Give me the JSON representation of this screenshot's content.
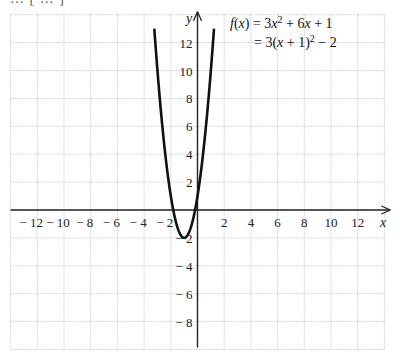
{
  "chart_data": {
    "type": "line",
    "title": "",
    "xlabel": "x",
    "ylabel": "y",
    "xlim": [
      -14,
      14
    ],
    "ylim": [
      -10,
      14
    ],
    "grid": true,
    "x_ticks": [
      -12,
      -10,
      -8,
      -6,
      -4,
      -2,
      2,
      4,
      6,
      8,
      10,
      12
    ],
    "x_tick_labels": [
      "− 12",
      "− 10",
      "− 8",
      "− 6",
      "− 4",
      "− 2",
      "2",
      "4",
      "6",
      "8",
      "10",
      "12"
    ],
    "y_ticks": [
      12,
      10,
      8,
      6,
      4,
      2,
      -2,
      -4,
      -6,
      -8
    ],
    "y_tick_labels": [
      "12",
      "10",
      "8",
      "6",
      "4",
      "2",
      "− 2",
      "− 4",
      "− 6",
      "− 8"
    ],
    "annotations": {
      "line1": "f(x) = 3x² + 6x + 1",
      "line2": "= 3(x + 1)² − 2"
    },
    "series": [
      {
        "name": "f(x) = 3x^2 + 6x + 1",
        "function": "3x^2 + 6x + 1",
        "domain": [
          -3.236,
          1.236
        ],
        "vertex": [
          -1,
          -2
        ],
        "y_intercept": 1,
        "x": [
          -3.236,
          -3,
          -2.5,
          -2,
          -1.5,
          -1,
          -0.5,
          0,
          0.5,
          1,
          1.236
        ],
        "values": [
          13,
          10,
          4.75,
          1,
          -1.25,
          -2,
          -1.25,
          1,
          4.75,
          10,
          13
        ]
      }
    ]
  },
  "caption_cropped": "… [ … ]"
}
